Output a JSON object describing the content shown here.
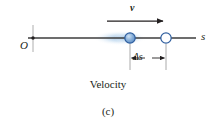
{
  "figure": {
    "panel_label": "(c)",
    "caption": "Velocity",
    "background_color": "#ffffff",
    "ink_color": "#231f20",
    "accent_color": "#4a7ebb",
    "glow_color": "#bcd4ec"
  },
  "axis": {
    "label": "s",
    "origin_label": "O",
    "line_color": "#3d3d3d",
    "y": 38,
    "x_start": 28,
    "x_end": 196
  },
  "origin_marker": {
    "name": "origin-tick",
    "x": 33,
    "top": 25,
    "bottom": 52,
    "dot_color": "#231f20"
  },
  "velocity_arrow": {
    "label": "v",
    "label_style": "bold-italic",
    "x_start": 107,
    "x_end": 168,
    "y": 21,
    "color": "#231f20",
    "direction": "right"
  },
  "particles": [
    {
      "name": "particle-initial",
      "x": 130,
      "y": 38,
      "radius": 5.2,
      "fill": "#7ea7d4",
      "stroke": "#2f5e9e",
      "style": "filled",
      "has_glow": true
    },
    {
      "name": "particle-final",
      "x": 166,
      "y": 38,
      "radius": 5.2,
      "fill": "#ffffff",
      "stroke": "#2f5e9e",
      "style": "hollow",
      "has_glow": false
    }
  ],
  "displacement": {
    "label": "Δs",
    "dimension_line_y": 58,
    "x_start": 130,
    "x_end": 166,
    "extension_top": 43,
    "extension_bottom": 70,
    "color": "#231f20"
  }
}
